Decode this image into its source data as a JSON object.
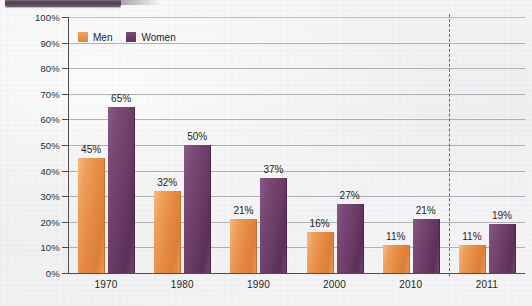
{
  "chart_data": {
    "type": "bar",
    "title": "",
    "xlabel": "",
    "ylabel": "Percentage",
    "ylim": [
      0,
      100
    ],
    "ytick_labels": [
      "100%",
      "90%",
      "80%",
      "70%",
      "60%",
      "50%",
      "40%",
      "30%",
      "20%",
      "10%",
      "0%"
    ],
    "ytick_values": [
      100,
      90,
      80,
      70,
      60,
      50,
      40,
      30,
      20,
      10,
      0
    ],
    "grid": true,
    "legend_position": "top-left",
    "categories": [
      "1970",
      "1980",
      "1990",
      "2000",
      "2010",
      "2011"
    ],
    "series": [
      {
        "name": "Men",
        "color": "#e5883f",
        "values": [
          45,
          32,
          21,
          16,
          11,
          11
        ],
        "labels": [
          "45%",
          "32%",
          "21%",
          "16%",
          "11%",
          "11%"
        ]
      },
      {
        "name": "Women",
        "color": "#6b3b66",
        "values": [
          65,
          50,
          37,
          27,
          21,
          19
        ],
        "labels": [
          "65%",
          "50%",
          "37%",
          "27%",
          "21%",
          "19%"
        ]
      }
    ],
    "annotations": [
      {
        "name": "series-break-divider",
        "type": "vertical-dashed-line",
        "after_category": "2010"
      }
    ]
  },
  "legend": {
    "items": [
      {
        "label": "Men",
        "swatch": "men-color-swatch"
      },
      {
        "label": "Women",
        "swatch": "women-color-swatch"
      }
    ]
  },
  "colors": {
    "men": "#e5883f",
    "women": "#6b3b66",
    "gridline": "#9a9aa6",
    "axis": "#4c4c55",
    "page_background": "#f2f2f4",
    "top_band": "#4a3d4a"
  }
}
